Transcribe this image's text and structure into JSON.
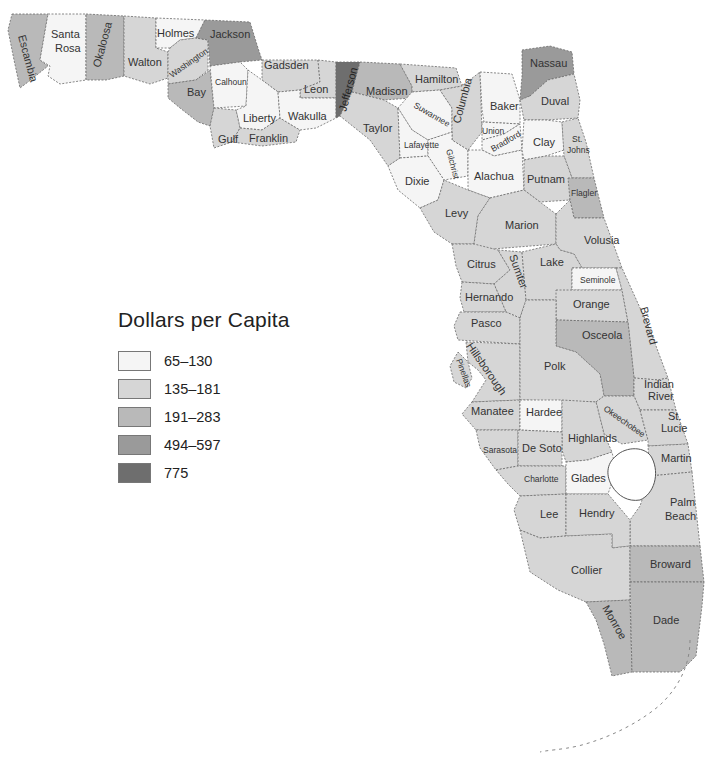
{
  "legend": {
    "title": "Dollars per Capita",
    "classes": [
      {
        "label": "65–130",
        "color": "#f5f5f5"
      },
      {
        "label": "135–181",
        "color": "#d6d6d6"
      },
      {
        "label": "191–283",
        "color": "#b9b9b9"
      },
      {
        "label": "494–597",
        "color": "#9a9a9a"
      },
      {
        "label": "775",
        "color": "#6e6e6e"
      }
    ]
  },
  "counties": {
    "escambia": "Escambia",
    "santa_rosa_1": "Santa",
    "santa_rosa_2": "Rosa",
    "okaloosa": "Okaloosa",
    "walton": "Walton",
    "holmes": "Holmes",
    "washington": "Washington",
    "jackson": "Jackson",
    "bay": "Bay",
    "calhoun": "Calhoun",
    "gadsden": "Gadsden",
    "liberty": "Liberty",
    "gulf": "Gulf",
    "franklin": "Franklin",
    "leon": "Leon",
    "wakulla": "Wakulla",
    "jefferson": "Jefferson",
    "madison": "Madison",
    "taylor": "Taylor",
    "hamilton": "Hamilton",
    "suwannee": "Suwannee",
    "columbia": "Columbia",
    "lafayette": "Lafayette",
    "gilchrist": "Gilchrist",
    "dixie": "Dixie",
    "baker": "Baker",
    "union": "Union",
    "bradford": "Bradford",
    "nassau": "Nassau",
    "duval": "Duval",
    "clay": "Clay",
    "st_johns_1": "St.",
    "st_johns_2": "Johns",
    "alachua": "Alachua",
    "putnam": "Putnam",
    "flagler": "Flagler",
    "levy": "Levy",
    "marion": "Marion",
    "volusia": "Volusia",
    "citrus": "Citrus",
    "sumter": "Sumter",
    "lake": "Lake",
    "seminole": "Seminole",
    "hernando": "Hernando",
    "orange": "Orange",
    "brevard": "Brevard",
    "pasco": "Pasco",
    "osceola": "Osceola",
    "hillsborough": "Hillsborough",
    "pinellas": "Pinellas",
    "polk": "Polk",
    "indian_river_1": "Indian",
    "indian_river_2": "River",
    "manatee": "Manatee",
    "hardee": "Hardee",
    "okeechobee": "Okeechobee",
    "st_lucie_1": "St.",
    "st_lucie_2": "Lucie",
    "sarasota": "Sarasota",
    "de_soto": "De Soto",
    "highlands": "Highlands",
    "martin": "Martin",
    "charlotte": "Charlotte",
    "glades": "Glades",
    "palm_beach_1": "Palm",
    "palm_beach_2": "Beach",
    "lee": "Lee",
    "hendry": "Hendry",
    "collier": "Collier",
    "broward": "Broward",
    "monroe": "Monroe",
    "dade": "Dade"
  }
}
